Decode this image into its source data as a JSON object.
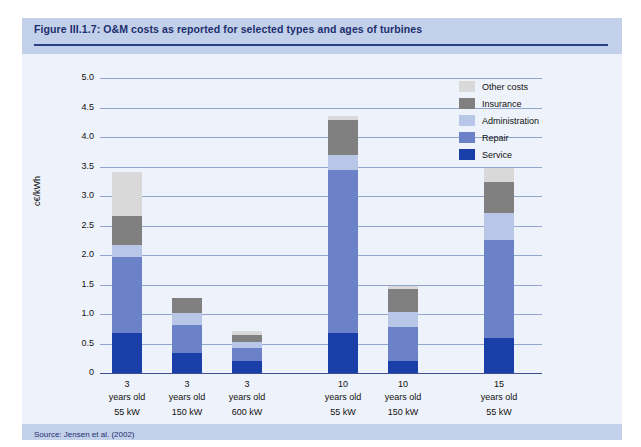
{
  "figure": {
    "title": "Figure III.1.7: O&M costs as reported for selected types and ages of turbines",
    "source": "Source: Jensen et al. (2002)"
  },
  "colors": {
    "other_costs": "#d9d9d9",
    "insurance": "#808080",
    "administration": "#b8c6e8",
    "repair": "#6b82c8",
    "service": "#1b3fa8",
    "title_band": "#c3d0ea",
    "panel_bg": "#eef2fa",
    "grid": "#8fa4cf",
    "axis": "#3c4f91",
    "title_text": "#1b2f6e"
  },
  "legend": {
    "position": "right",
    "items": [
      {
        "label": "Other costs",
        "color": "#d9d9d9"
      },
      {
        "label": "Insurance",
        "color": "#808080"
      },
      {
        "label": "Administration",
        "color": "#b8c6e8"
      },
      {
        "label": "Repair",
        "color": "#6b82c8"
      },
      {
        "label": "Service",
        "color": "#1b3fa8"
      }
    ]
  },
  "chart_data": {
    "type": "bar",
    "subtype": "stacked-vertical",
    "title": "Figure III.1.7: O&M costs as reported for selected types and ages of turbines",
    "xlabel": "",
    "ylabel": "c€/kWh",
    "ylim": [
      0,
      5.0
    ],
    "ytick_values": [
      0,
      0.5,
      1.0,
      1.5,
      2.0,
      2.5,
      3.0,
      3.5,
      4.0,
      4.5,
      5.0
    ],
    "ytick_labels": [
      "0",
      "0.5",
      "1.0",
      "1.5",
      "2.0",
      "2.5",
      "3.0",
      "3.5",
      "4.0",
      "4.5",
      "5.0"
    ],
    "grid": true,
    "grid_axis": "y",
    "categories": [
      {
        "age": "3",
        "age_line": "years old",
        "power": "55 kW",
        "group": 1
      },
      {
        "age": "3",
        "age_line": "years old",
        "power": "150 kW",
        "group": 1
      },
      {
        "age": "3",
        "age_line": "years old",
        "power": "600 kW",
        "group": 1
      },
      {
        "age": "10",
        "age_line": "years old",
        "power": "55 kW",
        "group": 2
      },
      {
        "age": "10",
        "age_line": "years old",
        "power": "150 kW",
        "group": 2
      },
      {
        "age": "15",
        "age_line": "years old",
        "power": "55 kW",
        "group": 3
      }
    ],
    "series": [
      {
        "name": "Service",
        "color": "#1b3fa8",
        "values": [
          0.67,
          0.34,
          0.2,
          0.68,
          0.2,
          0.6
        ]
      },
      {
        "name": "Repair",
        "color": "#6b82c8",
        "values": [
          1.3,
          0.47,
          0.22,
          2.76,
          0.58,
          1.65
        ]
      },
      {
        "name": "Administration",
        "color": "#b8c6e8",
        "values": [
          0.2,
          0.2,
          0.1,
          0.25,
          0.25,
          0.47
        ]
      },
      {
        "name": "Insurance",
        "color": "#808080",
        "values": [
          0.5,
          0.27,
          0.13,
          0.6,
          0.4,
          0.51
        ]
      },
      {
        "name": "Other costs",
        "color": "#d9d9d9",
        "values": [
          0.73,
          0.0,
          0.07,
          0.06,
          0.05,
          0.25
        ]
      }
    ],
    "totals": [
      3.4,
      1.28,
      0.72,
      4.35,
      1.48,
      3.48
    ]
  }
}
